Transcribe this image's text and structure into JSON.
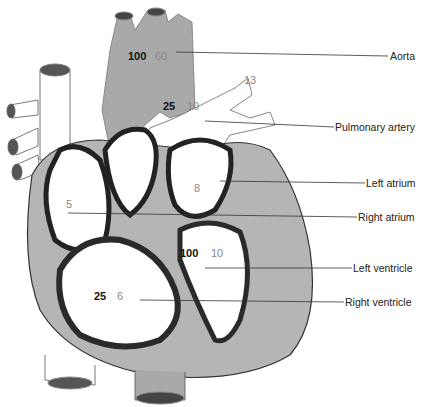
{
  "diagram": {
    "labels": {
      "aorta": "Aorta",
      "pulmonary_artery": "Pulmonary artery",
      "left_atrium": "Left atrium",
      "right_atrium": "Right atrium",
      "left_ventricle": "Left ventricle",
      "right_ventricle": "Right ventricle"
    },
    "values": {
      "aorta_systolic": "100",
      "aorta_diastolic": "60",
      "pulmonary_systolic": "25",
      "pulmonary_diastolic": "10",
      "pulmonary_branch": "13",
      "left_atrium": "8",
      "right_atrium": "5",
      "left_ventricle_systolic": "100",
      "left_ventricle_diastolic": "10",
      "right_ventricle_systolic": "25",
      "right_ventricle_diastolic": "6"
    },
    "colors": {
      "aorta_fill": "#a9a9a9",
      "muscle_fill": "#b5b5b5",
      "muscle_dark": "#3a3a3a",
      "chamber_fill": "#ffffff",
      "leader_line": "#333333"
    }
  }
}
